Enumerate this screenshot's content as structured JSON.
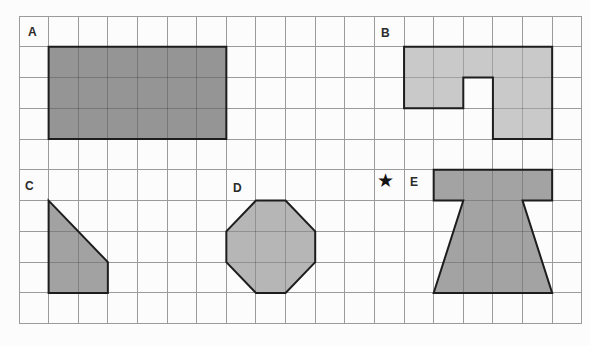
{
  "canvas": {
    "width": 590,
    "height": 346,
    "background": "#fcfcfc"
  },
  "grid": {
    "origin_x": 19,
    "origin_y": 16,
    "cols": 19,
    "rows": 10,
    "cell_width": 29.62,
    "cell_height": 30.77,
    "line_color": "#9b9b9b",
    "inner_line_darken": 0.2
  },
  "shapes": [
    {
      "label": "A",
      "fill": "#959595",
      "outline": "#1d1d1d",
      "vertices_cells": [
        [
          1,
          1
        ],
        [
          7,
          1
        ],
        [
          7,
          4
        ],
        [
          1,
          4
        ]
      ],
      "label_px": [
        28,
        36
      ]
    },
    {
      "label": "B",
      "fill": "#c9c9c9",
      "outline": "#1d1d1d",
      "vertices_cells": [
        [
          13,
          1
        ],
        [
          18,
          1
        ],
        [
          18,
          4
        ],
        [
          16,
          4
        ],
        [
          16,
          2
        ],
        [
          15,
          2
        ],
        [
          15,
          3
        ],
        [
          13,
          3
        ]
      ],
      "label_px": [
        381,
        37
      ]
    },
    {
      "label": "C",
      "fill": "#a2a2a2",
      "outline": "#1d1d1d",
      "vertices_cells": [
        [
          1,
          6
        ],
        [
          3,
          8
        ],
        [
          3,
          9
        ],
        [
          1,
          9
        ]
      ],
      "label_px": [
        25,
        190
      ]
    },
    {
      "label": "D",
      "fill": "#b6b6b6",
      "outline": "#1d1d1d",
      "vertices_cells": [
        [
          8,
          6
        ],
        [
          9,
          6
        ],
        [
          10,
          7
        ],
        [
          10,
          8
        ],
        [
          9,
          9
        ],
        [
          8,
          9
        ],
        [
          7,
          8
        ],
        [
          7,
          7
        ]
      ],
      "label_px": [
        233,
        192
      ]
    },
    {
      "label": "E",
      "fill": "#a3a3a3",
      "outline": "#1d1d1d",
      "vertices_cells": [
        [
          14,
          5
        ],
        [
          18,
          5
        ],
        [
          18,
          6
        ],
        [
          17,
          6
        ],
        [
          18,
          9
        ],
        [
          14,
          9
        ],
        [
          15,
          6
        ],
        [
          14,
          6
        ]
      ],
      "label_px": [
        410,
        186
      ]
    }
  ],
  "star": {
    "symbol": "★",
    "color": "#141414",
    "px": [
      377,
      187
    ],
    "font_size": 19
  }
}
